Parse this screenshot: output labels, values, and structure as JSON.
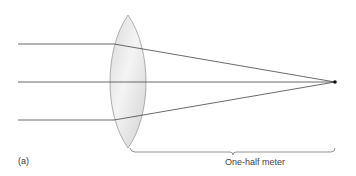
{
  "figure": {
    "panel_label": "(a)",
    "distance_label": "One-half meter",
    "colors": {
      "ray": "#444444",
      "lens_fill": "#e4e4e4",
      "lens_stroke": "#9a9a9a",
      "focal_point": "#111111",
      "bracket": "#777777"
    }
  },
  "elements": {
    "lens": "converging-lens-biconvex",
    "rays": [
      "top-ray",
      "axis-ray",
      "bottom-ray"
    ],
    "focal_point": "focal-point",
    "bracket": "distance-bracket"
  }
}
